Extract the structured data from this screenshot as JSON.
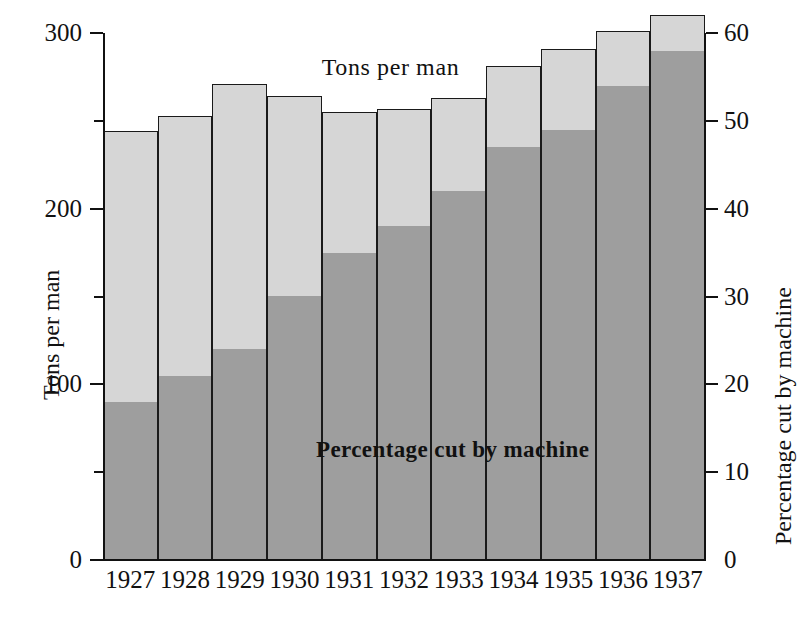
{
  "chart_data": {
    "type": "bar",
    "title": "",
    "categories": [
      "1927",
      "1928",
      "1929",
      "1930",
      "1931",
      "1932",
      "1933",
      "1934",
      "1935",
      "1936",
      "1937"
    ],
    "series": [
      {
        "name": "Tons per man",
        "axis": "left",
        "unit": "tons",
        "values": [
          244,
          253,
          271,
          264,
          255,
          257,
          263,
          281,
          291,
          301,
          310
        ]
      },
      {
        "name": "Percentage cut by machine",
        "axis": "right",
        "unit": "%",
        "values": [
          18,
          21,
          24,
          30,
          35,
          38,
          42,
          47,
          49,
          54,
          58
        ]
      }
    ],
    "xlabel": "",
    "ylabel": "Tons per man",
    "y2label": "Percentage cut by machine",
    "ylim": [
      0,
      300
    ],
    "y2lim": [
      0,
      60
    ],
    "yticks": [
      0,
      50,
      100,
      150,
      200,
      250,
      300
    ],
    "ytick_labels": [
      "0",
      "",
      "100",
      "",
      "200",
      "",
      "300"
    ],
    "y2ticks": [
      0,
      10,
      20,
      30,
      40,
      50,
      60
    ],
    "y2tick_labels": [
      "0",
      "10",
      "20",
      "30",
      "40",
      "50",
      "60"
    ],
    "grid": false,
    "legend_position": "inline-annotations",
    "annotations": [
      {
        "name": "tons-per-man-label",
        "text": "Tons per man"
      },
      {
        "name": "percentage-cut-label",
        "text": "Percentage cut by machine"
      }
    ],
    "colors": {
      "upper_segment": "#d6d6d6",
      "lower_segment": "#9e9e9e",
      "axis": "#111111",
      "background": "#ffffff"
    }
  },
  "axes": {
    "left": {
      "title": "Tons per man",
      "labels": [
        "300",
        "200",
        "100",
        "0"
      ]
    },
    "right": {
      "title": "Percentage cut by machine",
      "labels": [
        "60",
        "50",
        "40",
        "30",
        "20",
        "10",
        "0"
      ]
    }
  },
  "annotations": {
    "tons_per_man": "Tons per man",
    "percentage_cut": "Percentage cut by machine"
  }
}
